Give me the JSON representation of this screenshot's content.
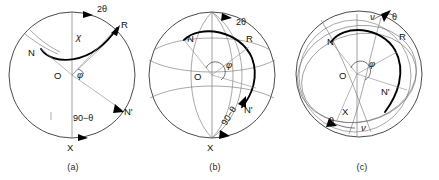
{
  "figure": {
    "background": "#ffffff",
    "ink": "#111111",
    "accent": "#000000"
  },
  "panels": [
    {
      "id": "a",
      "caption": "(a)",
      "type": "circle-projection",
      "points": [
        {
          "name": "O",
          "label": "O",
          "role": "center"
        },
        {
          "name": "N",
          "label": "N",
          "role": "pole-left"
        },
        {
          "name": "R",
          "label": "R",
          "role": "reflection"
        },
        {
          "name": "N-prime",
          "label": "N'",
          "role": "pole-right-lower"
        },
        {
          "name": "X",
          "label": "X",
          "role": "bottom-axis"
        }
      ],
      "angles": [
        {
          "name": "two-theta",
          "label": "2θ",
          "role": "arc-top"
        },
        {
          "name": "chi",
          "label": "χ",
          "role": "arc-upper-inner"
        },
        {
          "name": "phi",
          "label": "φ",
          "role": "center-angle"
        },
        {
          "name": "ninety-minus-theta",
          "label": "90−θ",
          "role": "arc-lower"
        }
      ]
    },
    {
      "id": "b",
      "caption": "(b)",
      "type": "sphere-projection",
      "points": [
        {
          "name": "O",
          "label": "O",
          "role": "center"
        },
        {
          "name": "N",
          "label": "N",
          "role": "pole-left"
        },
        {
          "name": "R",
          "label": "R",
          "role": "reflection"
        },
        {
          "name": "N-prime",
          "label": "N'",
          "role": "pole-right-lower"
        },
        {
          "name": "X",
          "label": "X",
          "role": "bottom-axis"
        }
      ],
      "angles": [
        {
          "name": "two-theta",
          "label": "2θ",
          "role": "arc-top"
        },
        {
          "name": "phi",
          "label": "φ",
          "role": "center-angle"
        },
        {
          "name": "ninety-minus-theta",
          "label": "90−θ",
          "role": "arc-lower-rotated"
        }
      ]
    },
    {
      "id": "c",
      "caption": "(c)",
      "type": "tilted-sphere-projection",
      "points": [
        {
          "name": "O",
          "label": "O",
          "role": "center"
        },
        {
          "name": "N",
          "label": "N",
          "role": "pole-left"
        },
        {
          "name": "R",
          "label": "R",
          "role": "reflection"
        },
        {
          "name": "N-prime",
          "label": "N'",
          "role": "pole-right-lower"
        },
        {
          "name": "X",
          "label": "X",
          "role": "lower-axis"
        }
      ],
      "angles": [
        {
          "name": "nu-top",
          "label": "ν",
          "role": "arc-top-left"
        },
        {
          "name": "theta-top",
          "label": "θ",
          "role": "arc-top-right"
        },
        {
          "name": "phi",
          "label": "φ",
          "role": "center-angle"
        },
        {
          "name": "theta-bottom",
          "label": "θ",
          "role": "arc-bottom-left"
        },
        {
          "name": "nu-bottom",
          "label": "ν",
          "role": "arc-bottom-right"
        }
      ]
    }
  ]
}
